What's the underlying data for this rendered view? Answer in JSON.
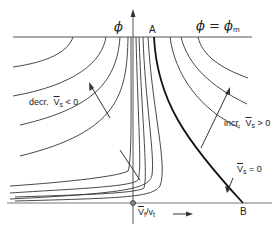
{
  "figure": {
    "labels": {
      "y_axis": "ϕ",
      "top_line": "ϕ = ϕ",
      "top_line_sub": "m",
      "point_a": "A",
      "point_b": "B",
      "decr_prefix": "decr.",
      "decr_var": "V",
      "decr_sub": "s",
      "decr_rel": "< 0",
      "incr_prefix": "incr.",
      "incr_var": "V",
      "incr_sub": "s",
      "incr_rel": "> 0",
      "zero_var": "V",
      "zero_sub": "s",
      "zero_rel": "= 0",
      "x_axis_num": "V",
      "x_axis_num_sub": "f",
      "x_axis_den": "/v",
      "x_axis_den_sub": "t"
    },
    "colors": {
      "line": "#333333",
      "axis": "#555555",
      "text": "#222222"
    }
  }
}
